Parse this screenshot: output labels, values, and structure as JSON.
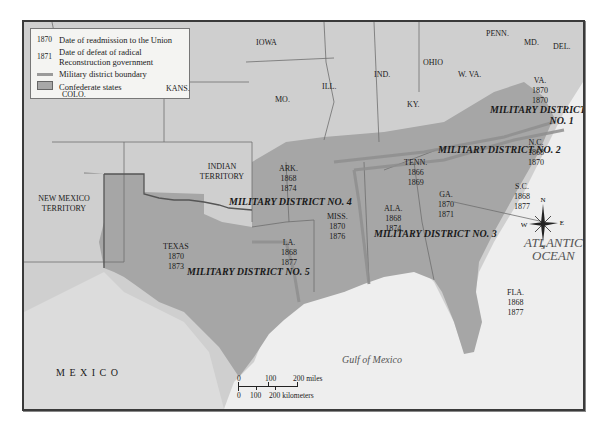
{
  "legend": {
    "items": [
      {
        "key": "1870",
        "label": "Date of readmission to the Union"
      },
      {
        "key": "1871",
        "label": "Date of defeat of radical Reconstruction government",
        "label_line1": "Date of defeat of radical",
        "label_line2": "Reconstruction government"
      },
      {
        "key": "line",
        "label": "Military district boundary"
      },
      {
        "key": "box",
        "label": "Confederate states"
      }
    ]
  },
  "regions": {
    "iowa": "IOWA",
    "ill": "ILL.",
    "ind": "IND.",
    "ohio": "OHIO",
    "penn": "PENN.",
    "md": "MD.",
    "del": "DEL.",
    "wva": "W. VA.",
    "ky": "KY.",
    "mo": "MO.",
    "kans": "KANS.",
    "colo": "COLO.",
    "indian_territory": "INDIAN TERRITORY",
    "new_mexico": "NEW MEXICO TERRITORY",
    "mexico": "M E X I C O"
  },
  "confederate_states": [
    {
      "name": "VA.",
      "readmitted": "1870",
      "defeat": "1870"
    },
    {
      "name": "N.C.",
      "readmitted": "1868",
      "defeat": "1870"
    },
    {
      "name": "TENN.",
      "readmitted": "1866",
      "defeat": "1869"
    },
    {
      "name": "S.C.",
      "readmitted": "1868",
      "defeat": "1877"
    },
    {
      "name": "GA.",
      "readmitted": "1870",
      "defeat": "1871"
    },
    {
      "name": "ALA.",
      "readmitted": "1868",
      "defeat": "1874"
    },
    {
      "name": "MISS.",
      "readmitted": "1870",
      "defeat": "1876"
    },
    {
      "name": "ARK.",
      "readmitted": "1868",
      "defeat": "1874"
    },
    {
      "name": "LA.",
      "readmitted": "1868",
      "defeat": "1877"
    },
    {
      "name": "TEXAS",
      "readmitted": "1870",
      "defeat": "1873"
    },
    {
      "name": "FLA.",
      "readmitted": "1868",
      "defeat": "1877"
    }
  ],
  "districts": {
    "d1_line1": "MILITARY DISTRICT",
    "d1_line2": "NO. 1",
    "d2": "MILITARY DISTRICT NO. 2",
    "d3": "MILITARY DISTRICT NO. 3",
    "d4": "MILITARY DISTRICT NO. 4",
    "d5": "MILITARY DISTRICT NO. 5"
  },
  "water": {
    "atlantic_line1": "ATLANTIC",
    "atlantic_line2": "OCEAN",
    "gulf": "Gulf of Mexico"
  },
  "compass": {
    "n": "N",
    "s": "S",
    "e": "E",
    "w": "W"
  },
  "scale": {
    "miles": [
      "0",
      "100",
      "200 miles"
    ],
    "km": [
      "0",
      "100",
      "200 kilometers"
    ]
  },
  "colors": {
    "confederate": "#a6a6a6",
    "union": "#c9c9c9",
    "water": "#efefef",
    "district_boundary": "#9a9a9a"
  }
}
